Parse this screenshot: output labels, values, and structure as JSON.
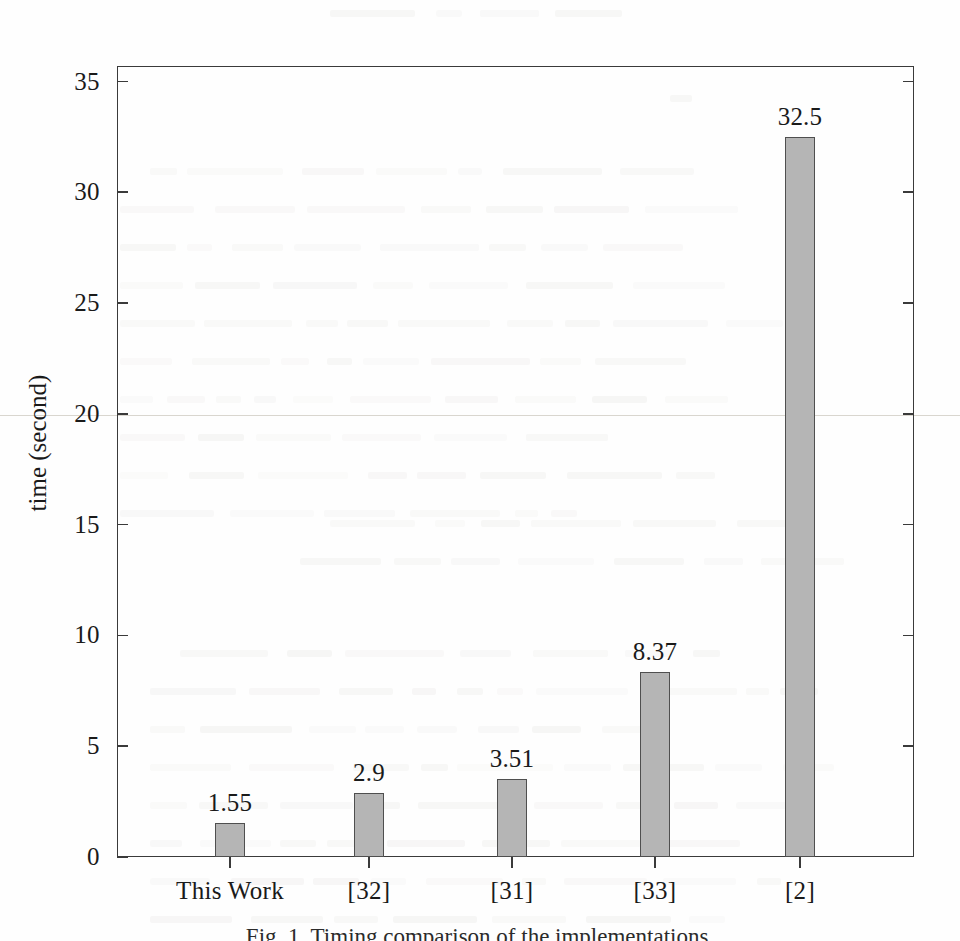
{
  "chart_data": {
    "type": "bar",
    "title": "",
    "xlabel": "",
    "ylabel": "time (second)",
    "categories": [
      "This Work",
      "[32]",
      "[31]",
      "[33]",
      "[2]"
    ],
    "values": [
      1.55,
      2.9,
      3.51,
      8.37,
      32.5
    ],
    "value_labels": [
      "1.55",
      "2.9",
      "3.51",
      "8.37",
      "32.5"
    ],
    "ylim": [
      0,
      35.7
    ],
    "yticks": [
      0,
      5,
      10,
      15,
      20,
      25,
      30,
      35
    ],
    "ytick_labels": [
      "0",
      "5",
      "10",
      "15",
      "20",
      "25",
      "30",
      "35"
    ],
    "grid": false,
    "legend": "none",
    "series": [
      {
        "name": "runtime",
        "values": [
          1.55,
          2.9,
          3.51,
          8.37,
          32.5
        ]
      }
    ],
    "bar_fill_color": "#b5b5b5",
    "bar_border_color": "#4f4f4f",
    "axis_color": "#3a3a3a"
  },
  "figure": {
    "caption": "Fig. 1.  Timing comparison of the implementations.",
    "background_note": "faint-scanned-page-bleed-through"
  }
}
